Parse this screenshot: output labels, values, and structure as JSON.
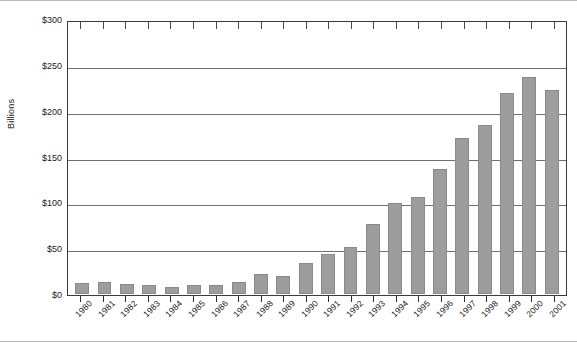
{
  "chart_data": {
    "type": "bar",
    "title": "",
    "xlabel": "",
    "ylabel": "Billions",
    "ylim": [
      0,
      300
    ],
    "ytick_labels": [
      "$0",
      "$50",
      "$100",
      "$150",
      "$200",
      "$250",
      "$300"
    ],
    "ytick_values": [
      0,
      50,
      100,
      150,
      200,
      250,
      300
    ],
    "grid": true,
    "legend": "none",
    "bar_color": "#9d9d9d",
    "categories": [
      "1980",
      "1981",
      "1982",
      "1983",
      "1984",
      "1985",
      "1986",
      "1987",
      "1988",
      "1989",
      "1990",
      "1991",
      "1992",
      "1993",
      "1994",
      "1995",
      "1996",
      "1997",
      "1998",
      "1999",
      "2000",
      "2001"
    ],
    "values": [
      12,
      13,
      11,
      10,
      8,
      10,
      10,
      13,
      22,
      20,
      34,
      44,
      52,
      77,
      100,
      107,
      137,
      171,
      186,
      221,
      238,
      224
    ]
  },
  "axes": {
    "y_title": "Billions"
  }
}
